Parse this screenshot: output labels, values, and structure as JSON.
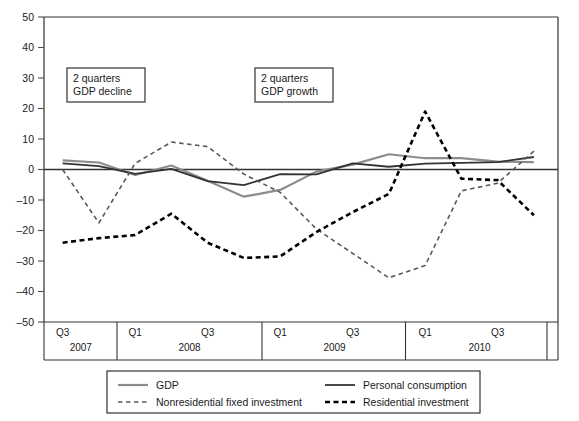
{
  "chart_data": {
    "type": "line",
    "title": "",
    "subtitle": "",
    "xlabel": "",
    "ylabel": "",
    "ylim": [
      -50,
      50
    ],
    "ytick_values": [
      50,
      40,
      30,
      20,
      10,
      0,
      -10,
      -20,
      -30,
      -40,
      -50
    ],
    "ytick_labels": [
      "50",
      "40",
      "30",
      "20",
      "10",
      "0",
      "–10",
      "–20",
      "–30",
      "–40",
      "–50"
    ],
    "grid": false,
    "legend_position": "bottom",
    "x": [
      "2007Q3",
      "2007Q4",
      "2008Q1",
      "2008Q2",
      "2008Q3",
      "2008Q4",
      "2009Q1",
      "2009Q2",
      "2009Q3",
      "2009Q4",
      "2010Q1",
      "2010Q2",
      "2010Q3",
      "2010Q4"
    ],
    "x_tick_labels": [
      {
        "label": "Q3",
        "x": "2007Q3"
      },
      {
        "label": "Q1",
        "x": "2008Q1"
      },
      {
        "label": "Q3",
        "x": "2008Q3"
      },
      {
        "label": "Q1",
        "x": "2009Q1"
      },
      {
        "label": "Q3",
        "x": "2009Q3"
      },
      {
        "label": "Q1",
        "x": "2010Q1"
      },
      {
        "label": "Q3",
        "x": "2010Q3"
      }
    ],
    "year_bands": [
      {
        "label": "2007",
        "start": "2007Q3",
        "end": "2007Q4"
      },
      {
        "label": "2008",
        "start": "2008Q1",
        "end": "2008Q4"
      },
      {
        "label": "2009",
        "start": "2009Q1",
        "end": "2009Q4"
      },
      {
        "label": "2010",
        "start": "2010Q1",
        "end": "2010Q4"
      }
    ],
    "series": [
      {
        "name": "GDP",
        "style": "solid",
        "color": "#8c8c8c",
        "width": 2.2,
        "values": [
          3.0,
          2.3,
          -1.8,
          1.3,
          -3.7,
          -8.9,
          -6.7,
          -0.7,
          1.6,
          5.0,
          3.7,
          3.7,
          2.6,
          2.4
        ]
      },
      {
        "name": "Personal consumption",
        "style": "solid",
        "color": "#333333",
        "width": 1.8,
        "values": [
          2.0,
          1.1,
          -1.4,
          0.2,
          -3.8,
          -5.1,
          -1.5,
          -1.6,
          2.0,
          0.9,
          1.9,
          2.2,
          2.4,
          4.1
        ]
      },
      {
        "name": "Nonresidential fixed investment",
        "style": "dashed",
        "color": "#595959",
        "width": 1.6,
        "values": [
          0.0,
          -17.5,
          2.0,
          9.0,
          7.5,
          -1.5,
          -7.5,
          -19.5,
          -27.5,
          -35.5,
          -31.5,
          -7.0,
          -4.5,
          6.0
        ]
      },
      {
        "name": "Residential investment",
        "style": "dashed",
        "color": "#000000",
        "width": 2.6,
        "values": [
          -24.0,
          -22.5,
          -21.5,
          -14.5,
          -24.0,
          -29.0,
          -28.5,
          -20.5,
          -14.0,
          -8.0,
          19.0,
          -3.0,
          -3.5,
          -15.0
        ]
      }
    ],
    "annotations": [
      {
        "id": "annot-gdp-decline",
        "line1": "2 quarters",
        "line2": "GDP decline",
        "x_px": 67,
        "y_px": 68,
        "w_px": 78,
        "h_px": 34
      },
      {
        "id": "annot-gdp-growth",
        "line1": "2 quarters",
        "line2": "GDP growth",
        "x_px": 255,
        "y_px": 68,
        "w_px": 78,
        "h_px": 34
      }
    ]
  },
  "legend": {
    "entries": [
      {
        "label": "GDP",
        "style": "solid",
        "color": "#8c8c8c",
        "width": 2.2
      },
      {
        "label": "Personal consumption",
        "style": "solid",
        "color": "#333333",
        "width": 1.8
      },
      {
        "label": "Nonresidential fixed investment",
        "style": "dashed",
        "color": "#595959",
        "width": 1.6
      },
      {
        "label": "Residential investment",
        "style": "dashed",
        "color": "#000000",
        "width": 2.6
      }
    ]
  },
  "colors": {
    "axis": "#4d4d4d",
    "frame": "#333333",
    "background": "#ffffff",
    "zero_line": "#333333"
  }
}
